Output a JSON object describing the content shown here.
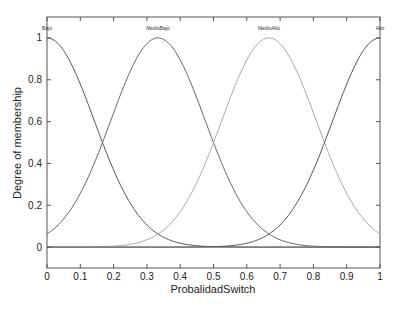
{
  "chart_data": {
    "type": "line",
    "title": "",
    "xlabel": "ProbalidadSwitch",
    "ylabel": "Degree of membership",
    "xlim": [
      0,
      1
    ],
    "ylim": [
      -0.1,
      1.1
    ],
    "grid": false,
    "legend": "none (curve labels at peaks)",
    "x_ticks": [
      "0",
      "0.1",
      "0.2",
      "0.3",
      "0.4",
      "0.5",
      "0.6",
      "0.7",
      "0.8",
      "0.9",
      "1"
    ],
    "y_ticks": [
      "0",
      "0.2",
      "0.4",
      "0.6",
      "0.8",
      "1"
    ],
    "function": "gaussmf",
    "series": [
      {
        "name": "Bajo",
        "sigma": 0.1415,
        "center": 0.0,
        "color": "#555555",
        "label_x": 0.0
      },
      {
        "name": "MedioBajo",
        "sigma": 0.1415,
        "center": 0.3333,
        "color": "#666666",
        "label_x": 0.3333
      },
      {
        "name": "MedioAlto",
        "sigma": 0.1415,
        "center": 0.6667,
        "color": "#aaaaaa",
        "label_x": 0.6667
      },
      {
        "name": "Alto",
        "sigma": 0.1415,
        "center": 1.0,
        "color": "#555555",
        "label_x": 1.0
      }
    ]
  },
  "layout": {
    "plot": {
      "left": 47,
      "right": 380,
      "top": 17,
      "bottom": 268
    },
    "frame_color": "#555555"
  }
}
